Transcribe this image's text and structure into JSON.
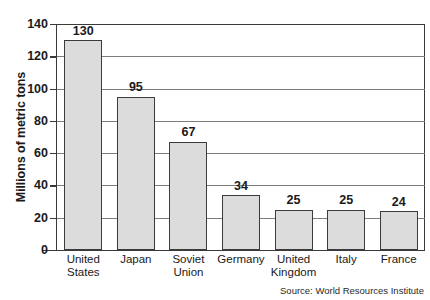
{
  "chart_data": {
    "type": "bar",
    "title": "",
    "xlabel": "",
    "ylabel": "Millions of metric tons",
    "ylim": [
      0,
      140
    ],
    "ytick_step": 20,
    "yticks": [
      0,
      20,
      40,
      60,
      80,
      100,
      120,
      140
    ],
    "grid": true,
    "legend": false,
    "categories": [
      "United States",
      "Japan",
      "Soviet Union",
      "Germany",
      "United Kingdom",
      "Italy",
      "France"
    ],
    "category_lines": [
      [
        "United",
        "States"
      ],
      [
        "Japan"
      ],
      [
        "Soviet",
        "Union"
      ],
      [
        "Germany"
      ],
      [
        "United",
        "Kingdom"
      ],
      [
        "Italy"
      ],
      [
        "France"
      ]
    ],
    "values": [
      130,
      95,
      67,
      34,
      25,
      25,
      24
    ],
    "value_labels": [
      "130",
      "95",
      "67",
      "34",
      "25",
      "25",
      "24"
    ],
    "bar_fill_color": "#dcdcdc",
    "bar_border_color": "#3b3b3b",
    "gridline_color": "#7d7d7d",
    "axis_color": "#3a3a3a",
    "background_color": "#ffffff"
  },
  "annotations": {
    "source": "Source: World Resources Institute",
    "title_remnant": ""
  }
}
